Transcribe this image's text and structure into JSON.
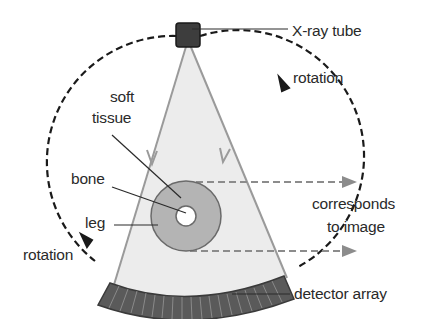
{
  "diagram": {
    "labels": {
      "xray_tube": "X-ray tube",
      "rotation_top": "rotation",
      "rotation_bottom": "rotation",
      "soft_tissue_line1": "soft",
      "soft_tissue_line2": "tissue",
      "bone": "bone",
      "leg": "leg",
      "corresponds_line1": "corresponds",
      "corresponds_line2": "to image",
      "detector_array": "detector array"
    },
    "colors": {
      "beam_fill": "#ececec",
      "beam_edge": "#9a9a9a",
      "leg_fill": "#b4b4b4",
      "tube_fill": "#3d3d3d",
      "detector_fill": "#5a5a5a",
      "dashed_path": "#1a1a1a",
      "projection_dash": "#8c8c8c"
    },
    "detector_segments": 20
  }
}
